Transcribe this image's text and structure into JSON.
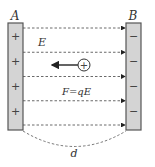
{
  "diagram": {
    "plate_a": {
      "label": "A",
      "sign": "+",
      "charge_marks": 4,
      "fill": "#d4d4d4",
      "stroke": "#555555"
    },
    "plate_b": {
      "label": "B",
      "sign": "−",
      "charge_marks": 4,
      "fill": "#d4d4d4",
      "stroke": "#555555"
    },
    "field_label": "E",
    "field_lines": 5,
    "field_direction": "A to B",
    "test_charge": {
      "sign": "+"
    },
    "force_label": "F=qE",
    "force_direction": "toward A",
    "distance_label": "d",
    "line_color": "#444444"
  }
}
